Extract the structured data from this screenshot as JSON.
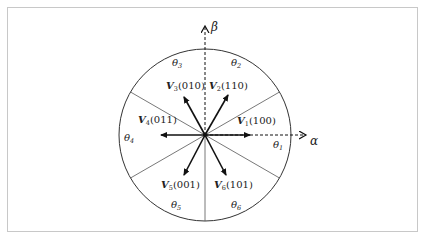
{
  "diagram": {
    "axes": {
      "alpha": {
        "label": "α"
      },
      "beta": {
        "label": "β"
      }
    },
    "vectors": [
      {
        "name": "V",
        "sub": "1",
        "code": "(100)",
        "angle_deg": 0
      },
      {
        "name": "V",
        "sub": "2",
        "code": "(110)",
        "angle_deg": 60
      },
      {
        "name": "V",
        "sub": "3",
        "code": "(010)",
        "angle_deg": 120
      },
      {
        "name": "V",
        "sub": "4",
        "code": "(011)",
        "angle_deg": 180
      },
      {
        "name": "V",
        "sub": "5",
        "code": "(001)",
        "angle_deg": 240
      },
      {
        "name": "V",
        "sub": "6",
        "code": "(101)",
        "angle_deg": 300
      }
    ],
    "sectors": [
      {
        "label": "θ",
        "sub": "1"
      },
      {
        "label": "θ",
        "sub": "2"
      },
      {
        "label": "θ",
        "sub": "3"
      },
      {
        "label": "θ",
        "sub": "4"
      },
      {
        "label": "θ",
        "sub": "5"
      },
      {
        "label": "θ",
        "sub": "6"
      }
    ],
    "colors": {
      "stroke": "#222222",
      "sector_line": "#555555",
      "frame": "#c8c8c8"
    }
  }
}
